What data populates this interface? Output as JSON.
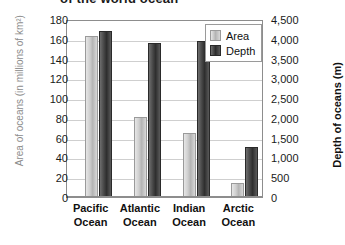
{
  "chart_data": {
    "type": "bar",
    "title": "of the world ocean",
    "categories": [
      "Pacific Ocean",
      "Atlantic Ocean",
      "Indian Ocean",
      "Arctic Ocean"
    ],
    "series": [
      {
        "name": "Area",
        "axis": "left",
        "values": [
          163,
          81,
          65,
          14
        ]
      },
      {
        "name": "Depth",
        "axis": "right",
        "values": [
          4200,
          3900,
          3950,
          1275
        ]
      }
    ],
    "xlabel": "",
    "ylabel": "Area of oceans (in millions of km²)",
    "y2label": "Depth of oceans (m)",
    "ylim": [
      0,
      180
    ],
    "y2lim": [
      0,
      4500
    ],
    "yticks": [
      "0",
      "20",
      "40",
      "60",
      "80",
      "100",
      "120",
      "140",
      "160",
      "180"
    ],
    "y2ticks": [
      "0",
      "500",
      "1,000",
      "1,500",
      "2,000",
      "2,500",
      "3,000",
      "3,500",
      "4,000",
      "4,500"
    ],
    "grid": true,
    "legend_position": "top-right",
    "colors": {
      "area": "#c8c8c8",
      "depth": "#3a3a3a",
      "grid": "#cfcfcf",
      "frame": "#8d8d8d",
      "left_axis_title": "#8c8c8c"
    }
  }
}
